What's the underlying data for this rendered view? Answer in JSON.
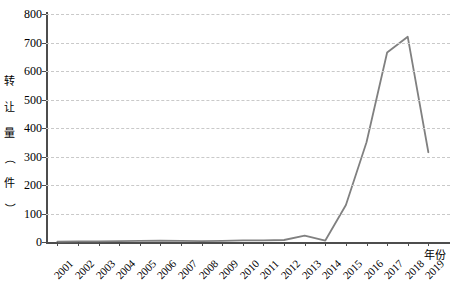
{
  "chart_data": {
    "type": "line",
    "title": "",
    "subtitle": "",
    "xlabel": "年份",
    "ylabel": "转让量（件）",
    "ylabel_chars": [
      "转",
      "让",
      "量",
      "（",
      "件",
      "）"
    ],
    "categories": [
      "2001",
      "2002",
      "2003",
      "2004",
      "2005",
      "2006",
      "2007",
      "2008",
      "2009",
      "2010",
      "2011",
      "2012",
      "2013",
      "2014",
      "2015",
      "2016",
      "2017",
      "2018",
      "2019"
    ],
    "series": [
      {
        "name": "转让量",
        "color": "#808080",
        "values": [
          1,
          2,
          2,
          3,
          4,
          5,
          4,
          3,
          4,
          6,
          6,
          7,
          22,
          5,
          130,
          350,
          665,
          720,
          315
        ]
      }
    ],
    "x": [
      "2001",
      "2002",
      "2003",
      "2004",
      "2005",
      "2006",
      "2007",
      "2008",
      "2009",
      "2010",
      "2011",
      "2012",
      "2013",
      "2014",
      "2015",
      "2016",
      "2017",
      "2018",
      "2019"
    ],
    "ylim": [
      0,
      800
    ],
    "y_ticks": [
      0,
      100,
      200,
      300,
      400,
      500,
      600,
      700,
      800
    ],
    "y_tick_labels": [
      "0",
      "100",
      "200",
      "300",
      "400",
      "500",
      "600",
      "700",
      "800"
    ],
    "grid": true,
    "grid_style": "dashed-horizontal",
    "grid_color": "#c9c9c9",
    "legend": null,
    "legend_position": "none",
    "axis_color": "#4d4d4d",
    "background": "#ffffff"
  }
}
